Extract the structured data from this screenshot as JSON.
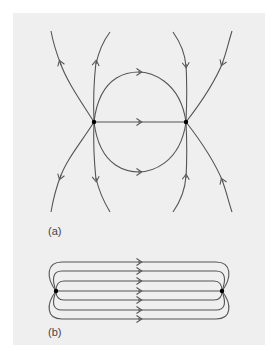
{
  "figure": {
    "panels": [
      {
        "id": "a",
        "label": "(a)",
        "description": "Field lines between two point charges of opposite sign",
        "charges": [
          {
            "x": 94,
            "y": 122
          },
          {
            "x": 186,
            "y": 122
          }
        ],
        "line_color": "#555555",
        "dot_color": "#000000"
      },
      {
        "id": "b",
        "label": "(b)",
        "description": "Field lines between two closely spaced point charges, nearly parallel",
        "charges": [
          {
            "x": 56,
            "y": 291
          },
          {
            "x": 222,
            "y": 291
          }
        ],
        "line_count": 7,
        "line_color": "#555555",
        "dot_color": "#000000"
      }
    ],
    "background_color": "#efefef"
  }
}
